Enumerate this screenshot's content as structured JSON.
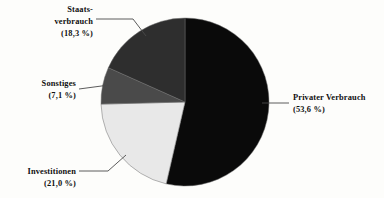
{
  "chart_data": {
    "type": "pie",
    "title": "",
    "subtitle": "",
    "xlabel": "",
    "ylabel": "",
    "legend_position": "callout-labels",
    "grid": false,
    "start_angle_deg": 0,
    "direction": "clockwise",
    "categories": [
      "Privater Verbrauch",
      "Investitionen",
      "Sonstiges",
      "Staatsverbrauch"
    ],
    "values": [
      53.6,
      21.0,
      7.1,
      18.3
    ],
    "unit": "%",
    "slices": [
      {
        "name": "Privater Verbrauch",
        "label": "Privater Verbrauch",
        "label_line1": "Privater Verbrauch",
        "percent_label": "(53,6 %)",
        "value": 53.6,
        "color": "#0a0a0a"
      },
      {
        "name": "Investitionen",
        "label": "Investitionen",
        "label_line1": "Investitionen",
        "percent_label": "(21,0 %)",
        "value": 21.0,
        "color": "#e8e8e8"
      },
      {
        "name": "Sonstiges",
        "label": "Sonstiges",
        "label_line1": "Sonstiges",
        "percent_label": "(7,1 %)",
        "value": 7.1,
        "color": "#4a4a4a"
      },
      {
        "name": "Staatsverbrauch",
        "label": "Staatsverbrauch",
        "label_line1": "Staats-",
        "label_line2": "verbrauch",
        "percent_label": "(18,3 %)",
        "value": 18.3,
        "color": "#2e2e2e"
      }
    ]
  },
  "colors": {
    "background": "#fdfdfb",
    "text": "#101010",
    "leader_line": "#4a4a4a",
    "slice_outline": "#6e6e6e",
    "privater_verbrauch": "#0a0a0a",
    "investitionen": "#e8e8e8",
    "sonstiges": "#4a4a4a",
    "staatsverbrauch": "#2e2e2e"
  }
}
